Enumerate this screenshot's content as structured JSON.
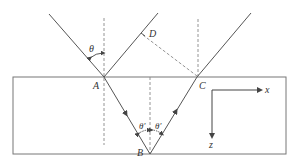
{
  "diagram": {
    "type": "ray-reflection-in-slab",
    "colors": {
      "line": "#555555",
      "dashed": "#888888",
      "label": "#333333",
      "background": "#ffffff"
    },
    "points": {
      "A": "A",
      "B": "B",
      "C": "C",
      "D": "D"
    },
    "angles": {
      "incident": "θ",
      "refracted_left": "θ′",
      "refracted_right": "θ′"
    },
    "axes": {
      "x": "x",
      "z": "z"
    }
  }
}
